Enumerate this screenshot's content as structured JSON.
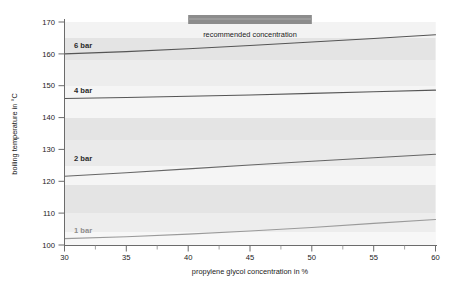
{
  "chart_data": {
    "type": "line",
    "title": "",
    "xlabel": "propylene glycol concentration in %",
    "ylabel": "boiling temperature in °C",
    "xlim": [
      30,
      60
    ],
    "ylim": [
      100,
      170
    ],
    "xticks": [
      30,
      35,
      40,
      45,
      50,
      55,
      60
    ],
    "xtick_labels": [
      "30",
      "35",
      "40",
      "45",
      "50",
      "55",
      "60"
    ],
    "xminor_ticks": [
      32.5,
      37.5,
      42.5,
      47.5,
      52.5,
      57.5
    ],
    "yticks": [
      100,
      110,
      120,
      130,
      140,
      150,
      160,
      170
    ],
    "ytick_labels": [
      "100",
      "110",
      "120",
      "130",
      "140",
      "150",
      "160",
      "170"
    ],
    "grid": false,
    "legend_position": "inline-labels",
    "series": [
      {
        "name": "6 bar",
        "label": "6 bar",
        "color": "#555555",
        "x": [
          30,
          35,
          40,
          45,
          50,
          55,
          60
        ],
        "values": [
          160.0,
          160.7,
          161.6,
          162.6,
          163.7,
          164.8,
          166.0
        ]
      },
      {
        "name": "4 bar",
        "label": "4 bar",
        "color": "#555555",
        "x": [
          30,
          35,
          40,
          45,
          50,
          55,
          60
        ],
        "values": [
          146.0,
          146.3,
          146.7,
          147.1,
          147.6,
          148.1,
          148.6
        ]
      },
      {
        "name": "2 bar",
        "label": "2 bar",
        "color": "#666666",
        "x": [
          30,
          35,
          40,
          45,
          50,
          55,
          60
        ],
        "values": [
          121.6,
          122.7,
          123.9,
          125.1,
          126.3,
          127.4,
          128.5
        ]
      },
      {
        "name": "1 bar",
        "label": "1 bar",
        "color": "#9a9a9a",
        "x": [
          30,
          35,
          40,
          45,
          50,
          55,
          60
        ],
        "values": [
          102.0,
          102.6,
          103.4,
          104.4,
          105.5,
          106.8,
          108.0
        ]
      }
    ],
    "annotations": [
      {
        "name": "recommended-concentration",
        "text": "recommended concentration",
        "x_start": 40,
        "x_end": 50,
        "bar_color": "#8c8c8c"
      }
    ],
    "bands": [
      {
        "from": 165,
        "to": 170,
        "color": "#f2f2f2"
      },
      {
        "from": 158,
        "to": 165,
        "color": "#e3e3e3"
      },
      {
        "from": 150,
        "to": 158,
        "color": "#ededed"
      },
      {
        "from": 140,
        "to": 150,
        "color": "#f4f4f4"
      },
      {
        "from": 133,
        "to": 140,
        "color": "#e3e3e3"
      },
      {
        "from": 125,
        "to": 133,
        "color": "#eaeaea"
      },
      {
        "from": 119,
        "to": 125,
        "color": "#f4f4f4"
      },
      {
        "from": 110,
        "to": 119,
        "color": "#e3e3e3"
      },
      {
        "from": 104,
        "to": 110,
        "color": "#ededed"
      },
      {
        "from": 100,
        "to": 104,
        "color": "#f6f6f6"
      }
    ],
    "axis_color": "#6b6b6b",
    "background": "#ffffff",
    "plot_background": "#f2f2f2"
  },
  "axes": {
    "ylabel": "boiling temperature in °C",
    "xlabel": "propylene glycol concentration in %",
    "ytick_100": "100",
    "ytick_110": "110",
    "ytick_120": "120",
    "ytick_130": "130",
    "ytick_140": "140",
    "ytick_150": "150",
    "ytick_160": "160",
    "ytick_170": "170",
    "xtick_30": "30",
    "xtick_35": "35",
    "xtick_40": "40",
    "xtick_45": "45",
    "xtick_50": "50",
    "xtick_55": "55",
    "xtick_60": "60"
  },
  "labels": {
    "series_6bar": "6 bar",
    "series_4bar": "4 bar",
    "series_2bar": "2 bar",
    "series_1bar": "1 bar",
    "recommended": "recommended concentration"
  }
}
